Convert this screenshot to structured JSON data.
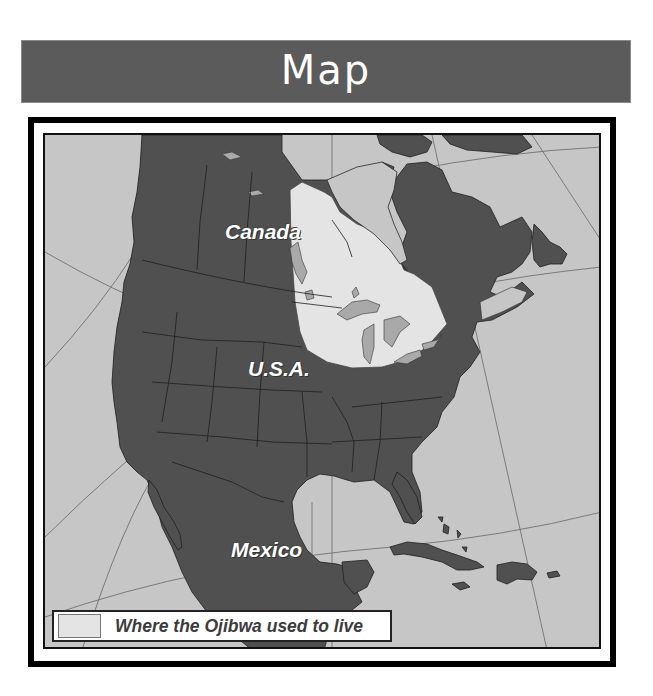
{
  "header": {
    "title": "Map"
  },
  "map": {
    "labels": {
      "canada": "Canada",
      "usa": "U.S.A.",
      "mexico": "Mexico"
    },
    "legend": {
      "swatch_color": "#e4e4e4",
      "text": "Where the Ojibwa used to live"
    },
    "colors": {
      "sea": "#c6c6c6",
      "land": "#505050",
      "ojibwa_region": "#e4e4e4",
      "lakes": "#a9a9a9",
      "header_bg": "#5b5b5b"
    }
  }
}
